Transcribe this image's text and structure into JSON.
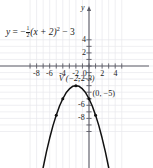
{
  "chart_data": {
    "type": "line",
    "title": "",
    "equation_text": "y = -1/2(x + 2)^2 - 3",
    "equation_parts": {
      "lhs": "y",
      "equals": "=",
      "minus": "−",
      "frac_num": "1",
      "frac_den": "2",
      "binomial": "(x + 2)",
      "exponent": "2",
      "tail": "− 3"
    },
    "xlabel": "x",
    "ylabel": "y",
    "xlim": [
      -9.5,
      5.5
    ],
    "ylim": [
      -10.5,
      4.5
    ],
    "x_ticks": [
      -8,
      -6,
      -4,
      -2,
      0,
      2,
      4
    ],
    "x_tick_labels": [
      "-8",
      "-6",
      "-4",
      "-2",
      "0",
      "2",
      "4"
    ],
    "y_ticks": [
      4,
      2,
      -2,
      -6,
      -8
    ],
    "y_tick_labels": [
      "4",
      "2",
      "-2",
      "-6",
      "-8"
    ],
    "grid": true,
    "grid_color": "#e8e8ec",
    "axis_color": "#5c5c66",
    "curve_color": "#111111",
    "legend_position": "none",
    "annotations": [
      {
        "name": "vertex-label",
        "text": "V (−2, −3)",
        "x": -4.6,
        "y": -2.1
      },
      {
        "name": "intercept-label",
        "text": "(0, −5)",
        "x": 0.55,
        "y": -4.4
      }
    ],
    "marked_points": [
      {
        "x": -2,
        "y": -3
      },
      {
        "x": 0,
        "y": -5
      },
      {
        "x": -4,
        "y": -5
      },
      {
        "x": 1,
        "y": -7.5
      },
      {
        "x": -5,
        "y": -7.5
      }
    ],
    "series": [
      {
        "name": "parabola",
        "vertex": [
          -2,
          -3
        ],
        "a": -0.5,
        "points": [
          [
            -7.4,
            -17.6
          ],
          [
            -7.0,
            -15.5
          ],
          [
            -6.5,
            -13.1
          ],
          [
            -6.0,
            -11.0
          ],
          [
            -5.5,
            -9.1
          ],
          [
            -5.0,
            -7.5
          ],
          [
            -4.5,
            -6.1
          ],
          [
            -4.0,
            -5.0
          ],
          [
            -3.5,
            -4.1
          ],
          [
            -3.0,
            -3.5
          ],
          [
            -2.5,
            -3.1
          ],
          [
            -2.0,
            -3.0
          ],
          [
            -1.5,
            -3.1
          ],
          [
            -1.0,
            -3.5
          ],
          [
            -0.5,
            -4.1
          ],
          [
            0.0,
            -5.0
          ],
          [
            0.5,
            -6.1
          ],
          [
            1.0,
            -7.5
          ],
          [
            1.5,
            -9.1
          ],
          [
            2.0,
            -11.0
          ],
          [
            2.5,
            -13.1
          ],
          [
            3.0,
            -15.5
          ],
          [
            3.4,
            -17.6
          ]
        ]
      }
    ]
  },
  "figure": {
    "origin_px": {
      "x": 89,
      "y": 66
    },
    "unit_px": 6.55
  }
}
